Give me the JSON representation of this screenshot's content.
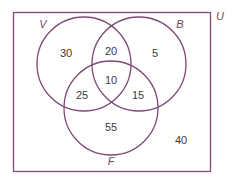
{
  "diagram": {
    "type": "venn-3",
    "universe_label": "U",
    "stroke_color": "#7d4a72",
    "sets": [
      {
        "label": "V",
        "cx": 84,
        "cy": 64,
        "r": 47
      },
      {
        "label": "B",
        "cx": 139,
        "cy": 64,
        "r": 47
      },
      {
        "label": "F",
        "cx": 111,
        "cy": 108,
        "r": 47
      }
    ],
    "regions": {
      "V_only": "30",
      "V_and_B_only": "20",
      "B_only": "5",
      "V_and_B_and_F": "10",
      "V_and_F_only": "25",
      "B_and_F_only": "15",
      "F_only": "55",
      "outside": "40"
    }
  }
}
